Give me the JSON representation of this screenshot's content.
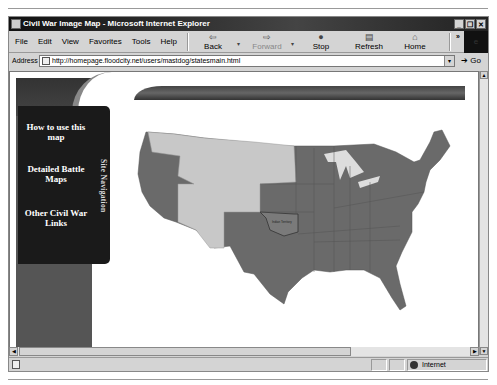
{
  "window": {
    "title": "Civil War Image Map - Microsoft Internet Explorer",
    "buttons": [
      "_",
      "❐",
      "✕"
    ]
  },
  "menu": [
    "File",
    "Edit",
    "View",
    "Favorites",
    "Tools",
    "Help"
  ],
  "toolbar": {
    "back": "Back",
    "forward": "Forward",
    "stop": "Stop",
    "refresh": "Refresh",
    "home": "Home",
    "more": "»"
  },
  "address": {
    "label": "Address",
    "url": "http://homepage.floodcity.net/users/mastdog/statesmain.html",
    "go": "Go"
  },
  "page": {
    "nav_items": [
      "How to use this map",
      "Detailed Battle Maps",
      "Other Civil War Links"
    ],
    "nav_title": "Site Navigation",
    "map_label": "Indian Territory"
  },
  "status": {
    "zone": "Internet"
  },
  "colors": {
    "union_states": "#6a6a6a",
    "territories": "#c8c8c8",
    "nav_bg": "#1a1a1a"
  }
}
